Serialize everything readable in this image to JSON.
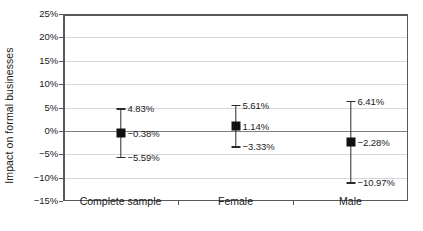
{
  "chart_data": {
    "type": "scatter",
    "title": "",
    "xlabel": "",
    "ylabel": "Impact on formal businesses",
    "ylim": [
      -15,
      25
    ],
    "ytick_step": 5,
    "ytick_labels": [
      "25%",
      "20%",
      "15%",
      "10%",
      "5%",
      "0%",
      "−5%",
      "−10%",
      "−15%"
    ],
    "ytick_values": [
      25,
      20,
      15,
      10,
      5,
      0,
      -5,
      -10,
      -15
    ],
    "grid": true,
    "legend": null,
    "categories": [
      "Complete sample",
      "Female",
      "Male"
    ],
    "series": [
      {
        "name": "Point estimate with confidence interval",
        "points": [
          {
            "category": "Complete sample",
            "value": -0.38,
            "upper": 4.83,
            "lower": -5.59,
            "value_label": "−0.38%",
            "upper_label": "4.83%",
            "lower_label": "−5.59%"
          },
          {
            "category": "Female",
            "value": 1.14,
            "upper": 5.61,
            "lower": -3.33,
            "value_label": "1.14%",
            "upper_label": "5.61%",
            "lower_label": "−3.33%"
          },
          {
            "category": "Male",
            "value": -2.28,
            "upper": 6.41,
            "lower": -10.97,
            "value_label": "−2.28%",
            "upper_label": "6.41%",
            "lower_label": "−10.97%"
          }
        ]
      }
    ],
    "colors": {
      "marker": "#111111",
      "error_bar": "#2b2b2b",
      "gridline": "#d6d6d6",
      "zero_line": "#7d7e80",
      "axis": "#58595b",
      "text": "#1a1a1a",
      "background": "#ffffff"
    }
  }
}
